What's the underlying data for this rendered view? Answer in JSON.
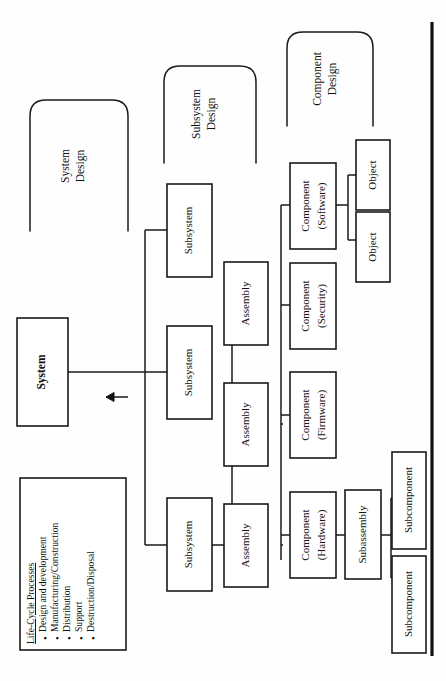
{
  "figure": {
    "orientation": "rotated-90-ccw",
    "background_color": "#fefefe",
    "line_color": "#1a1a1a"
  },
  "nodes": {
    "system": {
      "label": "System",
      "bold": true
    },
    "subsystem_1": {
      "label": "Subsystem"
    },
    "subsystem_2": {
      "label": "Subsystem"
    },
    "subsystem_3": {
      "label": "Subsystem"
    },
    "assembly_1": {
      "label": "Assembly"
    },
    "assembly_2": {
      "label": "Assembly"
    },
    "assembly_3": {
      "label": "Assembly"
    },
    "component_hardware": {
      "label_line1": "Component",
      "label_line2": "(Hardware)"
    },
    "component_firmware": {
      "label_line1": "Component",
      "label_line2": "(Firmware)"
    },
    "component_security": {
      "label_line1": "Component",
      "label_line2": "(Security)"
    },
    "component_software": {
      "label_line1": "Component",
      "label_line2": "(Software)"
    },
    "subassembly": {
      "label": "Subassembly"
    },
    "subcomponent_1": {
      "label": "Subcomponent"
    },
    "subcomponent_2": {
      "label": "Subcomponent"
    },
    "object_1": {
      "label": "Object"
    },
    "object_2": {
      "label": "Object"
    }
  },
  "braces": {
    "system_design": {
      "line1": "System",
      "line2": "Design"
    },
    "subsystem_design": {
      "line1": "Subsystem",
      "line2": "Design"
    },
    "component_design": {
      "line1": "Component",
      "line2": "Design"
    }
  },
  "lifecycle": {
    "title": "Life-Cycle Processes",
    "bullet_glyph": "•",
    "items": [
      "Design and development",
      "Manufacturing/Construction",
      "Distribution",
      "Support",
      "Destruction/Disposal"
    ]
  }
}
